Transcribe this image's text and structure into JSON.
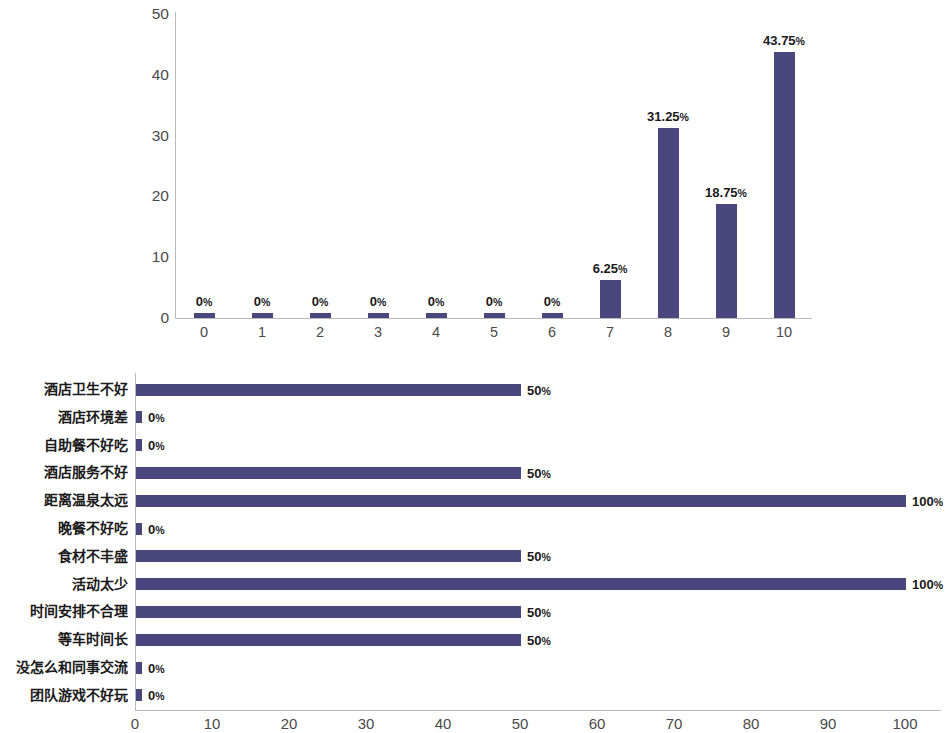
{
  "colors": {
    "bar": "#4a477e",
    "axis": "#b9b9b9",
    "tick_text": "#4a4a4a",
    "label_text": "#1a1a1a",
    "background": "#ffffff"
  },
  "chart_data": [
    {
      "type": "bar",
      "orientation": "vertical",
      "title": "",
      "xlabel": "",
      "ylabel": "",
      "categories": [
        "0",
        "1",
        "2",
        "3",
        "4",
        "5",
        "6",
        "7",
        "8",
        "9",
        "10"
      ],
      "values": [
        0,
        0,
        0,
        0,
        0,
        0,
        0,
        6.25,
        31.25,
        18.75,
        43.75
      ],
      "data_labels": [
        "0%",
        "0%",
        "0%",
        "0%",
        "0%",
        "0%",
        "0%",
        "6.25%",
        "31.25%",
        "18.75%",
        "43.75%"
      ],
      "ylim": [
        0,
        50
      ],
      "yticks": [
        "0",
        "10",
        "20",
        "30",
        "40",
        "50"
      ],
      "ytick_values": [
        0,
        10,
        20,
        30,
        40,
        50
      ],
      "grid": false,
      "legend": "none"
    },
    {
      "type": "bar",
      "orientation": "horizontal",
      "title": "",
      "xlabel": "",
      "ylabel": "",
      "categories": [
        "酒店卫生不好",
        "酒店环境差",
        "自助餐不好吃",
        "酒店服务不好",
        "距离温泉太远",
        "晚餐不好吃",
        "食材不丰盛",
        "活动太少",
        "时间安排不合理",
        "等车时间长",
        "没怎么和同事交流",
        "团队游戏不好玩"
      ],
      "values": [
        50,
        0,
        0,
        50,
        100,
        0,
        50,
        100,
        50,
        50,
        0,
        0
      ],
      "data_labels": [
        "50%",
        "0%",
        "0%",
        "50%",
        "100%",
        "0%",
        "50%",
        "100%",
        "50%",
        "50%",
        "0%",
        "0%"
      ],
      "xlim": [
        0,
        100
      ],
      "xticks": [
        "0",
        "10",
        "20",
        "30",
        "40",
        "50",
        "60",
        "70",
        "80",
        "90",
        "100"
      ],
      "xtick_values": [
        0,
        10,
        20,
        30,
        40,
        50,
        60,
        70,
        80,
        90,
        100
      ],
      "grid": false,
      "legend": "none"
    }
  ]
}
